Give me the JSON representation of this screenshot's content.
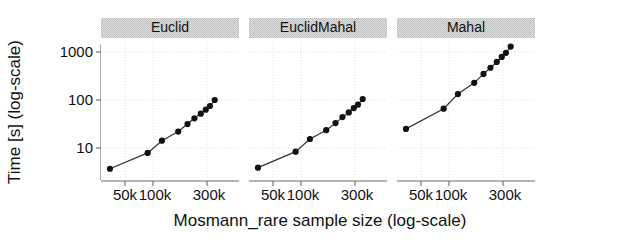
{
  "figure": {
    "background": "#ffffff",
    "point_color": "#111111",
    "line_color": "#333333",
    "grid_color": "#d9d9d9",
    "strip_fill": "#d4d4d4",
    "axis_color": "#5a5a5a"
  },
  "axes": {
    "xlabel": "Mosmann_rare sample size (log-scale)",
    "ylabel": "Time [s] (log-scale)",
    "x_ticks": [
      "50k",
      "100k",
      "300k"
    ],
    "x_tick_values": [
      50000,
      100000,
      300000
    ],
    "y_ticks": [
      "10",
      "100",
      "1000"
    ],
    "y_tick_values": [
      10,
      100,
      1000
    ],
    "xlim": [
      30000,
      420000
    ],
    "ylim": [
      2.6,
      2100
    ],
    "x_scale": "log",
    "y_scale": "log",
    "grid": true
  },
  "chart_data": {
    "type": "line",
    "title": "",
    "xlabel": "Mosmann_rare sample size (log-scale)",
    "ylabel": "Time [s] (log-scale)",
    "x_scale": "log",
    "y_scale": "log",
    "xlim": [
      30000,
      420000
    ],
    "ylim": [
      2.6,
      2100
    ],
    "legend_position": "none",
    "facet_labels": [
      "Euclid",
      "EuclidMahal",
      "Mahal"
    ],
    "x": [
      36000,
      82000,
      112000,
      160000,
      196000,
      228000,
      262000,
      292000,
      320000,
      355000
    ],
    "series": [
      {
        "name": "Euclid",
        "values": [
          3.7,
          7.9,
          14.2,
          22.0,
          31.5,
          41.5,
          52.0,
          63.0,
          75.0,
          100.0
        ]
      },
      {
        "name": "EuclidMahal",
        "values": [
          3.9,
          8.4,
          15.4,
          23.5,
          33.0,
          44.0,
          55.0,
          68.0,
          80.0,
          105.0
        ]
      },
      {
        "name": "Mahal",
        "values": [
          25.0,
          66.0,
          133.0,
          228.0,
          350.0,
          470.0,
          620.0,
          790.0,
          960.0,
          1300.0
        ]
      }
    ]
  },
  "panels": [
    {
      "id": "panel-euclid",
      "label": "Euclid"
    },
    {
      "id": "panel-euclidmahal",
      "label": "EuclidMahal"
    },
    {
      "id": "panel-mahal",
      "label": "Mahal"
    }
  ]
}
